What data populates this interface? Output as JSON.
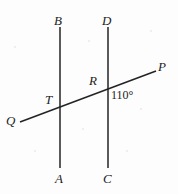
{
  "figure": {
    "width": 178,
    "height": 194,
    "background_color": "#fdfdfd",
    "ink_color": "#232323",
    "stroke_width": 1.4
  },
  "labels": {
    "B": "B",
    "D": "D",
    "A": "A",
    "C": "C",
    "P": "P",
    "Q": "Q",
    "T": "T",
    "R": "R",
    "angle": "110°"
  },
  "geometry": {
    "line_AB": {
      "name": "left-vertical-line",
      "top_label": "B",
      "bottom_label": "A",
      "x": 60,
      "y_top": 27,
      "y_bottom": 168
    },
    "line_CD": {
      "name": "right-vertical-line",
      "top_label": "D",
      "bottom_label": "C",
      "x": 108,
      "y_top": 27,
      "y_bottom": 168
    },
    "line_QP": {
      "name": "transversal-line",
      "left_label": "Q",
      "right_label": "P",
      "x1": 20,
      "y1": 122,
      "x2": 156,
      "y2": 71
    },
    "intersections": [
      {
        "label": "T",
        "x": 60,
        "y": 103
      },
      {
        "label": "R",
        "x": 108,
        "y": 89
      }
    ],
    "angle_marking": {
      "value": "110°",
      "at_vertex": "R",
      "position": {
        "x": 111,
        "y": 89
      }
    }
  },
  "label_positions": {
    "B": {
      "x": 54,
      "y": 14
    },
    "D": {
      "x": 102,
      "y": 14
    },
    "A": {
      "x": 55,
      "y": 172
    },
    "C": {
      "x": 103,
      "y": 172
    },
    "P": {
      "x": 158,
      "y": 60
    },
    "Q": {
      "x": 6,
      "y": 114
    },
    "T": {
      "x": 45,
      "y": 93
    },
    "R": {
      "x": 89,
      "y": 74
    }
  }
}
